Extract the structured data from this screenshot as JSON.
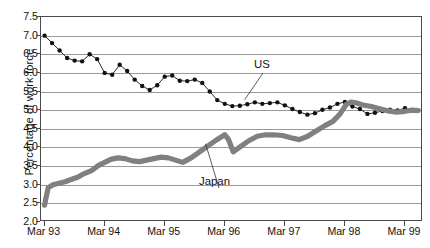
{
  "chart_data": {
    "type": "line",
    "title": "",
    "xlabel": "",
    "ylabel": "Percentage of work force",
    "ylim": [
      2.0,
      7.5
    ],
    "ygrid": true,
    "ytick_labels": [
      "7.5",
      "7.0",
      "6.5",
      "6.0",
      "5.5",
      "5.0",
      "4.5",
      "4.0",
      "3.5",
      "3.0",
      "2.5",
      "2.0"
    ],
    "ytick_values": [
      7.5,
      7.0,
      6.5,
      6.0,
      5.5,
      5.0,
      4.5,
      4.0,
      3.5,
      3.0,
      2.5,
      2.0
    ],
    "xtick_labels": [
      "Mar 93",
      "Mar 94",
      "Mar 95",
      "Mar 96",
      "Mar 97",
      "Mar 98",
      "Mar 99"
    ],
    "xtick_values": [
      0,
      1,
      2,
      3,
      4,
      5,
      6
    ],
    "xlim": [
      -0.06,
      6.3
    ],
    "legend_position": "inline-annotations",
    "annotations": [
      {
        "name": "US",
        "text": "US",
        "point_x": 3.33,
        "point_y": 5.28
      },
      {
        "name": "Japan",
        "text": "Japan",
        "point_x": 2.68,
        "point_y": 4.1
      }
    ],
    "series": [
      {
        "name": "US",
        "style": "line-with-markers",
        "color": "#111111",
        "marker": "filled-circle",
        "x": [
          0.0,
          0.125,
          0.25,
          0.375,
          0.5,
          0.625,
          0.75,
          0.875,
          1.0,
          1.125,
          1.25,
          1.375,
          1.5,
          1.625,
          1.75,
          1.875,
          2.0,
          2.125,
          2.25,
          2.375,
          2.5,
          2.625,
          2.75,
          2.875,
          3.0,
          3.125,
          3.25,
          3.375,
          3.5,
          3.625,
          3.75,
          3.875,
          4.0,
          4.125,
          4.25,
          4.375,
          4.5,
          4.625,
          4.75,
          4.875,
          5.0,
          5.125,
          5.25,
          5.375,
          5.5,
          5.625,
          5.75,
          5.875,
          6.0,
          6.125
        ],
        "values": [
          7.0,
          6.8,
          6.6,
          6.4,
          6.33,
          6.31,
          6.5,
          6.37,
          6.0,
          5.95,
          6.22,
          6.05,
          5.82,
          5.65,
          5.54,
          5.67,
          5.9,
          5.93,
          5.79,
          5.78,
          5.82,
          5.73,
          5.5,
          5.27,
          5.17,
          5.11,
          5.12,
          5.16,
          5.21,
          5.17,
          5.19,
          5.21,
          5.13,
          5.03,
          4.95,
          4.88,
          4.92,
          5.01,
          5.07,
          5.17,
          5.22,
          5.1,
          5.03,
          4.9,
          4.93,
          4.98,
          5.01,
          4.99,
          5.05,
          5.0
        ]
      },
      {
        "name": "Japan",
        "style": "thick-line",
        "color": "#808080",
        "marker": "none",
        "x": [
          0.0,
          0.02,
          0.06,
          0.14,
          0.24,
          0.34,
          0.44,
          0.55,
          0.66,
          0.78,
          0.9,
          1.0,
          1.1,
          1.22,
          1.34,
          1.46,
          1.58,
          1.7,
          1.82,
          1.94,
          2.06,
          2.18,
          2.3,
          2.44,
          2.58,
          2.72,
          2.86,
          3.0,
          3.06,
          3.14,
          3.26,
          3.4,
          3.54,
          3.68,
          3.82,
          3.96,
          4.1,
          4.24,
          4.38,
          4.52,
          4.66,
          4.8,
          4.92,
          5.02,
          5.1,
          5.18,
          5.3,
          5.44,
          5.58,
          5.72,
          5.86,
          6.0,
          6.12,
          6.22
        ],
        "values": [
          2.45,
          2.62,
          2.92,
          3.0,
          3.04,
          3.08,
          3.14,
          3.2,
          3.3,
          3.38,
          3.52,
          3.6,
          3.68,
          3.72,
          3.7,
          3.64,
          3.62,
          3.66,
          3.7,
          3.74,
          3.72,
          3.66,
          3.6,
          3.72,
          3.88,
          4.04,
          4.2,
          4.34,
          4.22,
          3.88,
          4.02,
          4.18,
          4.3,
          4.34,
          4.34,
          4.32,
          4.26,
          4.21,
          4.3,
          4.44,
          4.58,
          4.7,
          4.9,
          5.15,
          5.22,
          5.2,
          5.14,
          5.1,
          5.04,
          4.98,
          4.95,
          4.97,
          5.0,
          4.99
        ]
      }
    ]
  }
}
